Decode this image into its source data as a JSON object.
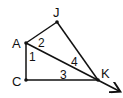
{
  "diagram": {
    "points": {
      "J": {
        "label": "J",
        "x": 57,
        "y": 22
      },
      "A": {
        "label": "A",
        "x": 26,
        "y": 43
      },
      "C": {
        "label": "C",
        "x": 26,
        "y": 80
      },
      "K": {
        "label": "K",
        "x": 98,
        "y": 80
      }
    },
    "angles": [
      "1",
      "2",
      "3",
      "4"
    ],
    "segments": [
      "AJ",
      "JK",
      "AC",
      "CK",
      "AK (ray extended beyond K)"
    ]
  }
}
